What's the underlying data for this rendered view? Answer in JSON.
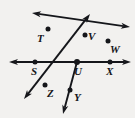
{
  "figure": {
    "background_color": "#f2f1ef",
    "ink_color": "#15161a",
    "width": 135,
    "height": 118,
    "center": {
      "label": "U",
      "x": 77,
      "y": 62
    }
  },
  "points": [
    {
      "id": "T",
      "label": "T",
      "dot_x": 48,
      "dot_y": 29,
      "label_x": 37,
      "label_y": 33
    },
    {
      "id": "V",
      "label": "V",
      "dot_x": 85,
      "dot_y": 35,
      "label_x": 88,
      "label_y": 31
    },
    {
      "id": "W",
      "label": "W",
      "dot_x": 108,
      "dot_y": 41,
      "label_x": 110,
      "label_y": 44
    },
    {
      "id": "S",
      "label": "S",
      "dot_x": 35,
      "dot_y": 62,
      "label_x": 31,
      "label_y": 66
    },
    {
      "id": "U",
      "label": "U",
      "dot_x": 77,
      "dot_y": 62,
      "label_x": 74,
      "label_y": 66
    },
    {
      "id": "X",
      "label": "X",
      "dot_x": 110,
      "dot_y": 62,
      "label_x": 106,
      "label_y": 66
    },
    {
      "id": "Z",
      "label": "Z",
      "dot_x": 45,
      "dot_y": 85,
      "label_x": 47,
      "label_y": 88
    },
    {
      "id": "Y",
      "label": "Y",
      "dot_x": 70,
      "dot_y": 90,
      "label_x": 74,
      "label_y": 92
    }
  ],
  "lines": [
    {
      "id": "line-S-X",
      "name": "horizontal-line-through-S-U-X",
      "through": [
        "S",
        "U",
        "X"
      ],
      "x1": 9,
      "y1": 62,
      "x2": 131,
      "y2": 62,
      "arrows": "both"
    },
    {
      "id": "line-T-W",
      "name": "line-through-T-U-W",
      "through": [
        "T",
        "U",
        "W"
      ],
      "x1": 32,
      "y1": 13,
      "x2": 130,
      "y2": 27,
      "arrows": "both"
    },
    {
      "id": "line-V-Z",
      "name": "line-through-V-U-Z",
      "through": [
        "V",
        "U",
        "Z"
      ],
      "x1": 90,
      "y1": 14,
      "x2": 24,
      "y2": 99,
      "arrows": "both"
    },
    {
      "id": "ray-U-Y",
      "name": "ray-U-through-Y",
      "through": [
        "U",
        "Y"
      ],
      "x1": 77,
      "y1": 62,
      "x2": 63,
      "y2": 114,
      "arrows": "end"
    }
  ]
}
